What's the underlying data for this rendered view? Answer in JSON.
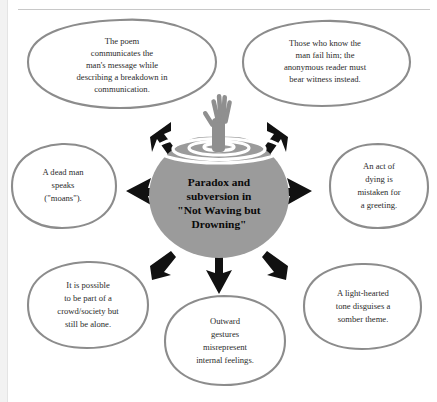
{
  "diagram": {
    "type": "concept-map",
    "center": {
      "label": "Paradox and subversion in \"Not Waving but Drowning\"",
      "lines": [
        "Paradox and",
        "subversion in",
        "\"Not Waving but",
        "Drowning\""
      ],
      "fill_color": "#9b9b9b",
      "text_color": "#0a0a0a"
    },
    "imagery": {
      "hand_icon": "drowning-hand-icon",
      "ripples_icon": "water-ripples-icon"
    },
    "colors": {
      "bubble_outline": "#8c8c8c",
      "bubble_fill": "#ffffff",
      "arrow": "#111111",
      "text": "#2b2b2b",
      "page_background": "#ffffff",
      "rule": "#c8c8c8"
    },
    "nodes": [
      {
        "id": "top-left",
        "position": "top-left",
        "arrow": "arrow-up-left",
        "label": "The poem communicates the man's message while describing a breakdown in communication.",
        "lines": [
          "The poem",
          "communicates the",
          "man's message while",
          "describing a breakdown in",
          "communication."
        ]
      },
      {
        "id": "top-right",
        "position": "top-right",
        "arrow": "arrow-up-right",
        "label": "Those who know the man fail him; the anonymous reader must bear witness instead.",
        "lines": [
          "Those who know the",
          "man fail him; the",
          "anonymous reader must",
          "bear witness instead."
        ]
      },
      {
        "id": "left",
        "position": "left",
        "arrow": "arrow-left",
        "label": "A dead man speaks (\"moans\").",
        "lines": [
          "A dead man",
          "speaks",
          "(\"moans\")."
        ]
      },
      {
        "id": "right",
        "position": "right",
        "arrow": "arrow-right",
        "label": "An act of dying is mistaken for a greeting.",
        "lines": [
          "An act of",
          "dying is",
          "mistaken for",
          "a greeting."
        ]
      },
      {
        "id": "bottom-left",
        "position": "bottom-left",
        "arrow": "arrow-down-left",
        "label": "It is possible to be part of a crowd/society but still be alone.",
        "lines": [
          "It is possible",
          "to be part of a",
          "crowd/society but",
          "still be alone."
        ]
      },
      {
        "id": "bottom-center",
        "position": "bottom-center",
        "arrow": "arrow-down",
        "label": "Outward gestures misrepresent internal feelings.",
        "lines": [
          "Outward",
          "gestures",
          "misrepresent",
          "internal feelings."
        ]
      },
      {
        "id": "bottom-right",
        "position": "bottom-right",
        "arrow": "arrow-down-right",
        "label": "A light-hearted tone disguises a somber theme.",
        "lines": [
          "A light-hearted",
          "tone disguises a",
          "somber theme."
        ]
      }
    ]
  }
}
